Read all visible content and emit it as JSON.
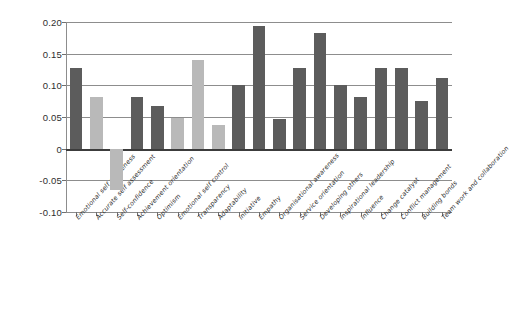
{
  "chart_data": {
    "type": "bar",
    "title": "",
    "subtitle": "",
    "xlabel": "",
    "ylabel": "",
    "ylim": [
      -0.1,
      0.2
    ],
    "grid": true,
    "legend": "none",
    "ytick_labels": [
      "0.20",
      "0.15",
      "0.10",
      "0.05",
      "0",
      "-0.05",
      "-0.10"
    ],
    "ytick_values": [
      0.2,
      0.15,
      0.1,
      0.05,
      0,
      -0.05,
      -0.1
    ],
    "categories": [
      "Emotional self awareness",
      "Accurate self assessment",
      "Self-confidence",
      "Achievement orientation",
      "Optimism",
      "Emotional self control",
      "Transparency",
      "Adaptability",
      "Initiative",
      "Empathy",
      "Organisational awareness",
      "Service orientation",
      "Developing others",
      "Inspirational leadership",
      "Influence",
      "Change catalyst",
      "Conflict management",
      "Building bonds",
      "Team work and collaboration"
    ],
    "values": [
      0.128,
      0.082,
      -0.065,
      0.082,
      0.068,
      0.049,
      0.14,
      0.038,
      0.1,
      0.194,
      0.047,
      0.128,
      0.182,
      0.1,
      0.082,
      0.128,
      0.128,
      0.075,
      0.112
    ],
    "bar_shades": [
      "dark",
      "light",
      "light",
      "dark",
      "dark",
      "light",
      "light",
      "light",
      "dark",
      "dark",
      "dark",
      "dark",
      "dark",
      "dark",
      "dark",
      "dark",
      "dark",
      "dark",
      "dark"
    ],
    "colors": {
      "dark_bar": "#5c5c5c",
      "light_bar": "#b9b9b9",
      "gridline": "#8d8d8d",
      "zero_line": "#3c3c3c",
      "background": "#ffffff",
      "text": "#2d2d2d"
    }
  }
}
